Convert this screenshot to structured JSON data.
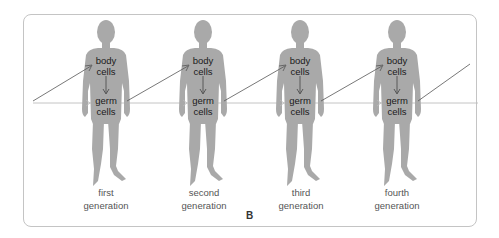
{
  "diagram": {
    "panel_letter": "B",
    "colors": {
      "silhouette": "#a9a9a9",
      "arrow_line": "#555555",
      "germ_line": "#bdbdbd",
      "frame": "#c4c4c4"
    },
    "figures": [
      {
        "body_label": [
          "body",
          "cells"
        ],
        "germ_label": [
          "germ",
          "cells"
        ],
        "generation": [
          "first",
          "generation"
        ]
      },
      {
        "body_label": [
          "body",
          "cells"
        ],
        "germ_label": [
          "germ",
          "cells"
        ],
        "generation": [
          "second",
          "generation"
        ]
      },
      {
        "body_label": [
          "body",
          "cells"
        ],
        "germ_label": [
          "germ",
          "cells"
        ],
        "generation": [
          "third",
          "generation"
        ]
      },
      {
        "body_label": [
          "body",
          "cells"
        ],
        "germ_label": [
          "germ",
          "cells"
        ],
        "generation": [
          "fourth",
          "generation"
        ]
      }
    ]
  }
}
